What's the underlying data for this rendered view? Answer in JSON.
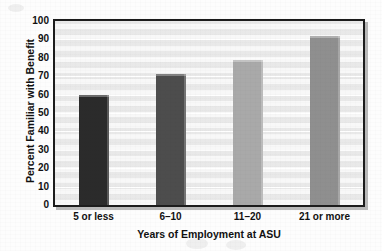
{
  "chart_data": {
    "type": "bar",
    "title": "",
    "xlabel": "Years of Employment at ASU",
    "ylabel": "Percent Familiar with Benefit",
    "categories": [
      "5 or less",
      "6–10",
      "11–20",
      "21 or more"
    ],
    "values": [
      60,
      71,
      79,
      92
    ],
    "series": [
      {
        "name": "Percent Familiar with Benefit",
        "values": [
          60,
          71,
          79,
          92
        ]
      }
    ],
    "bar_colors": [
      "#2b2b2b",
      "#4d4d4d",
      "#a9a9a9",
      "#8f8f8f"
    ],
    "ylim": [
      0,
      100
    ],
    "ytick_labels": [
      "100",
      "90",
      "80",
      "70",
      "60",
      "50",
      "40",
      "30",
      "20",
      "10",
      "0"
    ],
    "ytick_values": [
      100,
      90,
      80,
      70,
      60,
      50,
      40,
      30,
      20,
      10,
      0
    ],
    "ytick_step": 10,
    "grid": true,
    "grid_axis": "y",
    "legend": false,
    "legend_position": "none",
    "plot_background": "#f0f0f0",
    "frame_color": "#1c1c1c",
    "gridline_color": "#ffffff",
    "text_color": "#111111"
  },
  "figure": {
    "page_background": "#fdfdfd",
    "has_drop_shadow": true,
    "shadow_color": "#b9b9b9"
  }
}
